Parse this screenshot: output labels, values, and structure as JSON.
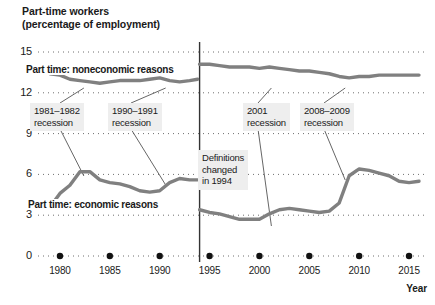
{
  "chart_data": {
    "type": "line",
    "title": "Part-time workers",
    "subtitle": "(percentage of employment)",
    "xlabel": "Year",
    "ylabel": "",
    "xlim": [
      1978,
      2016.5
    ],
    "ylim": [
      0,
      15
    ],
    "grid": "horizontal-dotted",
    "legend": "inline-labels",
    "yticks": [
      "0",
      "3",
      "6",
      "9",
      "12",
      "15"
    ],
    "ytick_values": [
      0,
      3,
      6,
      9,
      12,
      15
    ],
    "xticks": [
      "1980",
      "1985",
      "1990",
      "1995",
      "2000",
      "2005",
      "2010",
      "2015"
    ],
    "xtick_values": [
      1980,
      1985,
      1990,
      1995,
      2000,
      2005,
      2010,
      2015
    ],
    "series": [
      {
        "name": "Part time: noneconomic reasons",
        "label": "Part time: noneconomic reasons",
        "color": "#808080",
        "segments": [
          {
            "x": [
              1979,
              1980,
              1981,
              1982,
              1983,
              1984,
              1985,
              1986,
              1987,
              1988,
              1989,
              1990,
              1991,
              1992,
              1993,
              1993.8
            ],
            "y": [
              13.4,
              13.3,
              13.0,
              12.9,
              12.8,
              12.7,
              12.8,
              12.9,
              12.9,
              12.9,
              13.0,
              13.1,
              12.9,
              12.8,
              12.9,
              13.0
            ]
          },
          {
            "x": [
              1994,
              1995,
              1996,
              1997,
              1998,
              1999,
              2000,
              2001,
              2002,
              2003,
              2004,
              2005,
              2006,
              2007,
              2008,
              2009,
              2010,
              2011,
              2012,
              2013,
              2014,
              2015,
              2016
            ],
            "y": [
              14.1,
              14.1,
              14.0,
              13.9,
              13.9,
              13.9,
              13.8,
              13.9,
              13.8,
              13.7,
              13.6,
              13.6,
              13.5,
              13.4,
              13.2,
              13.1,
              13.2,
              13.2,
              13.3,
              13.3,
              13.3,
              13.3,
              13.3
            ]
          }
        ]
      },
      {
        "name": "Part time: economic reasons",
        "label": "Part time: economic reasons",
        "color": "#808080",
        "segments": [
          {
            "x": [
              1979,
              1980,
              1981,
              1982,
              1983,
              1984,
              1985,
              1986,
              1987,
              1988,
              1989,
              1990,
              1991,
              1992,
              1993,
              1993.8
            ],
            "y": [
              3.6,
              4.6,
              5.2,
              6.2,
              6.2,
              5.6,
              5.4,
              5.3,
              5.1,
              4.8,
              4.7,
              4.8,
              5.4,
              5.7,
              5.6,
              5.6
            ]
          },
          {
            "x": [
              1994,
              1995,
              1996,
              1997,
              1998,
              1999,
              2000,
              2001,
              2002,
              2003,
              2004,
              2005,
              2006,
              2007,
              2008,
              2009,
              2010,
              2011,
              2012,
              2013,
              2014,
              2015,
              2016
            ],
            "y": [
              3.4,
              3.2,
              3.1,
              2.9,
              2.7,
              2.7,
              2.7,
              3.1,
              3.4,
              3.5,
              3.4,
              3.3,
              3.2,
              3.3,
              3.9,
              5.9,
              6.4,
              6.3,
              6.1,
              5.9,
              5.5,
              5.4,
              5.5
            ]
          }
        ]
      }
    ],
    "annotations": [
      {
        "name": "recession-1981-1982",
        "text_line1": "1981–1982",
        "text_line2": "recession",
        "x": 1982
      },
      {
        "name": "recession-1990-1991",
        "text_line1": "1990–1991",
        "text_line2": "recession",
        "x": 1990.5
      },
      {
        "name": "recession-2001",
        "text_line1": "2001",
        "text_line2": "recession",
        "x": 2001
      },
      {
        "name": "recession-2008-2009",
        "text_line1": "2008–2009",
        "text_line2": "recession",
        "x": 2008.7
      },
      {
        "name": "definitions-changed",
        "text_line1": "Definitions",
        "text_line2": "changed",
        "text_line3": "in 1994",
        "x": 1994
      }
    ],
    "vertical_rule": {
      "x": 1994,
      "color": "#333333",
      "label": "Definitions changed in 1994"
    },
    "colors": {
      "line": "#808080",
      "grid": "#6e6e6e",
      "callout_bg": "#eeeeee",
      "text": "#1a1a1a",
      "rule": "#333333"
    }
  }
}
